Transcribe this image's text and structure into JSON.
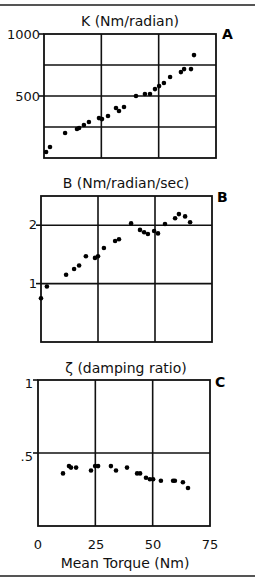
{
  "figure": {
    "x_ticks": [
      "0",
      "25",
      "50",
      "75"
    ],
    "x_label": "Mean Torque (Nm)"
  },
  "chart_data": [
    {
      "type": "scatter",
      "panel": "A",
      "title": "K  (Nm/radian)",
      "xlabel": "Mean Torque (Nm)",
      "ylabel": "K (Nm/radian)",
      "xlim": [
        0,
        75
      ],
      "ylim": [
        0,
        1000
      ],
      "y_tick_labels": [
        "1000",
        "500"
      ],
      "y_ticks": [
        1000,
        500
      ],
      "y_gridlines": [
        250,
        500,
        750
      ],
      "x_gridlines": [
        25,
        50
      ],
      "grid": true,
      "points": [
        [
          0.9,
          48
        ],
        [
          2.6,
          89
        ],
        [
          9.2,
          202
        ],
        [
          14.4,
          234
        ],
        [
          15.3,
          242
        ],
        [
          17.4,
          266
        ],
        [
          19.6,
          290
        ],
        [
          24.0,
          322
        ],
        [
          25.3,
          314
        ],
        [
          27.9,
          339
        ],
        [
          31.4,
          403
        ],
        [
          32.7,
          379
        ],
        [
          34.9,
          411
        ],
        [
          40.1,
          500
        ],
        [
          44.0,
          516
        ],
        [
          46.2,
          516
        ],
        [
          48.4,
          556
        ],
        [
          50.2,
          580
        ],
        [
          52.3,
          605
        ],
        [
          55.0,
          653
        ],
        [
          59.7,
          693
        ],
        [
          61.1,
          717
        ],
        [
          64.1,
          717
        ],
        [
          65.4,
          830
        ]
      ]
    },
    {
      "type": "scatter",
      "panel": "B",
      "title": "B   (Nm/radian/sec)",
      "xlabel": "Mean Torque (Nm)",
      "ylabel": "B (Nm/radian/sec)",
      "xlim": [
        0,
        75
      ],
      "ylim": [
        0,
        2.5
      ],
      "y_tick_labels": [
        "2",
        "1"
      ],
      "y_ticks": [
        2,
        1
      ],
      "y_gridlines": [
        1,
        2
      ],
      "x_gridlines": [
        25,
        50
      ],
      "grid": true,
      "points": [
        [
          0.0,
          0.75
        ],
        [
          2.6,
          0.95
        ],
        [
          11.0,
          1.15
        ],
        [
          14.5,
          1.25
        ],
        [
          16.7,
          1.31
        ],
        [
          19.7,
          1.47
        ],
        [
          23.7,
          1.44
        ],
        [
          25.0,
          1.47
        ],
        [
          27.6,
          1.61
        ],
        [
          32.5,
          1.73
        ],
        [
          34.2,
          1.76
        ],
        [
          39.5,
          2.03
        ],
        [
          43.4,
          1.92
        ],
        [
          45.2,
          1.88
        ],
        [
          46.9,
          1.85
        ],
        [
          49.6,
          1.9
        ],
        [
          51.3,
          1.86
        ],
        [
          54.4,
          2.02
        ],
        [
          58.8,
          2.12
        ],
        [
          60.5,
          2.19
        ],
        [
          63.2,
          2.15
        ],
        [
          65.4,
          2.05
        ]
      ]
    },
    {
      "type": "scatter",
      "panel": "C",
      "title": "ζ  (damping ratio)",
      "xlabel": "Mean Torque (Nm)",
      "ylabel": "ζ (damping ratio)",
      "xlim": [
        0,
        75
      ],
      "ylim": [
        0,
        1
      ],
      "y_tick_labels": [
        "1",
        ".5"
      ],
      "y_ticks": [
        1,
        0.5
      ],
      "y_gridlines": [
        0.5
      ],
      "x_gridlines": [
        25,
        50
      ],
      "x_tick_labels": [
        "0",
        "25",
        "50",
        "75"
      ],
      "grid": true,
      "points": [
        [
          10.9,
          0.36
        ],
        [
          13.5,
          0.41
        ],
        [
          14.4,
          0.4
        ],
        [
          16.6,
          0.4
        ],
        [
          23.1,
          0.38
        ],
        [
          24.9,
          0.41
        ],
        [
          26.2,
          0.41
        ],
        [
          31.8,
          0.41
        ],
        [
          34.0,
          0.38
        ],
        [
          38.8,
          0.4
        ],
        [
          43.2,
          0.36
        ],
        [
          44.5,
          0.36
        ],
        [
          47.1,
          0.33
        ],
        [
          48.8,
          0.32
        ],
        [
          50.2,
          0.32
        ],
        [
          53.6,
          0.31
        ],
        [
          58.9,
          0.31
        ],
        [
          59.7,
          0.31
        ],
        [
          63.2,
          0.3
        ],
        [
          65.4,
          0.26
        ]
      ]
    }
  ]
}
